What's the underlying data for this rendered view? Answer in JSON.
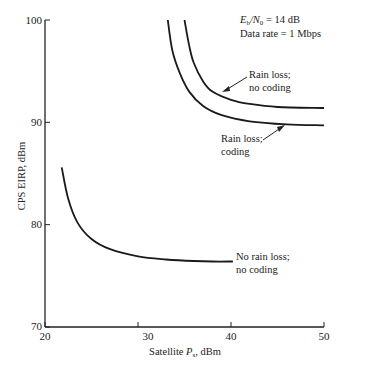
{
  "chart_data": {
    "type": "line",
    "title": "",
    "annotation_lines": [
      "E_b/N_0 = 14 dB",
      "Data rate = 1 Mbps"
    ],
    "annotation": {
      "ebno_label": "E",
      "ebno_sub_b": "b",
      "ebno_mid": "/N",
      "ebno_sub_0": "0",
      "ebno_value": " = 14 dB",
      "rate": "Data rate = 1 Mbps"
    },
    "xlabel": "Satellite P_s, dBm",
    "xlabel_parts": {
      "main": "Satellite ",
      "italic": "P",
      "sub": "s",
      "tail": ", dBm"
    },
    "ylabel": "CPS EIRP, dBm",
    "xlim": [
      20,
      50
    ],
    "ylim": [
      70,
      100
    ],
    "xticks": [
      "20",
      "30",
      "40",
      "50"
    ],
    "yticks": [
      "70",
      "80",
      "90",
      "100"
    ],
    "grid": false,
    "legend": "none (inline labels)",
    "series": [
      {
        "name": "Rain loss; no coding",
        "label_lines": [
          "Rain loss;",
          "no coding"
        ],
        "x": [
          35.0,
          35.5,
          36,
          37,
          38,
          40,
          42,
          45,
          50
        ],
        "y": [
          100,
          97.5,
          95.8,
          94.0,
          93.0,
          92.2,
          91.8,
          91.5,
          91.4
        ]
      },
      {
        "name": "Rain loss; coding",
        "label_lines": [
          "Rain loss;",
          "coding"
        ],
        "x": [
          33.2,
          33.7,
          34.5,
          35.5,
          37,
          39,
          42,
          46,
          50
        ],
        "y": [
          100,
          97.0,
          94.8,
          93.0,
          91.6,
          90.7,
          90.1,
          89.8,
          89.7
        ]
      },
      {
        "name": "No rain loss; no coding",
        "label_lines": [
          "No rain loss;",
          "no coding"
        ],
        "x": [
          21.8,
          22.5,
          23.5,
          25,
          27,
          30,
          33,
          36,
          38,
          40.2
        ],
        "y": [
          85.6,
          82.5,
          80.2,
          78.6,
          77.6,
          76.9,
          76.6,
          76.45,
          76.4,
          76.4
        ]
      }
    ]
  }
}
